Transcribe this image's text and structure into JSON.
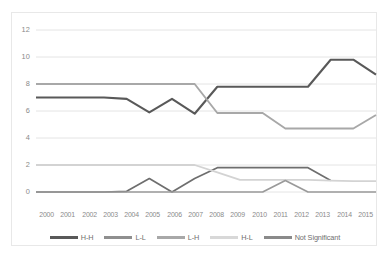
{
  "chart_data": {
    "type": "line",
    "title": "",
    "subtitle": "",
    "xlabel": "",
    "ylabel": "",
    "ylim": [
      0,
      12
    ],
    "yticks": [
      0,
      2,
      4,
      6,
      8,
      10,
      12
    ],
    "grid": true,
    "legend_position": "bottom",
    "categories": [
      "2000",
      "2001",
      "2002",
      "2003",
      "2004",
      "2005",
      "2006",
      "2007",
      "2008",
      "2009",
      "2010",
      "2011",
      "2012",
      "2013",
      "2014",
      "2015"
    ],
    "series": [
      {
        "name": "H-H",
        "color": "#595959",
        "width": 2.1,
        "values": [
          7.0,
          7.0,
          7.0,
          7.0,
          6.9,
          5.9,
          6.9,
          5.8,
          7.8,
          7.8,
          7.8,
          7.8,
          7.8,
          9.8,
          9.8,
          8.7
        ]
      },
      {
        "name": "L-L",
        "color": "#6e6e6e",
        "width": 1.7,
        "values": [
          0.0,
          0.0,
          0.0,
          0.0,
          0.05,
          1.0,
          0.0,
          1.0,
          1.8,
          1.8,
          1.8,
          1.8,
          1.8,
          0.85,
          null,
          null
        ]
      },
      {
        "name": "L-H",
        "color": "#a8a8a8",
        "width": 1.9,
        "values": [
          8.0,
          8.0,
          8.0,
          8.0,
          8.0,
          8.0,
          8.0,
          8.0,
          5.85,
          5.85,
          5.85,
          4.7,
          4.7,
          4.7,
          4.7,
          5.7
        ]
      },
      {
        "name": "H-L",
        "color": "#d3d3d3",
        "width": 1.8,
        "values": [
          2.0,
          2.0,
          2.0,
          2.0,
          2.0,
          2.0,
          2.0,
          2.0,
          1.45,
          0.9,
          0.9,
          0.9,
          0.9,
          0.85,
          0.8,
          0.8
        ]
      },
      {
        "name": "Not Significant",
        "color": "#9a9a9a",
        "width": 1.7,
        "values": [
          0.0,
          0.0,
          0.0,
          0.0,
          0.0,
          0.0,
          0.0,
          0.0,
          0.0,
          0.0,
          0.0,
          0.85,
          0.0,
          0.0,
          0.0,
          0.0
        ]
      }
    ]
  },
  "axes": {
    "y_tick_labels": [
      "12",
      "10",
      "8",
      "6",
      "4",
      "2",
      "0"
    ]
  },
  "legend": {
    "items": [
      {
        "label": "H-H",
        "color": "#595959"
      },
      {
        "label": "L-L",
        "color": "#8f8f8f"
      },
      {
        "label": "L-H",
        "color": "#a8a8a8"
      },
      {
        "label": "H-L",
        "color": "#d8d8d8"
      },
      {
        "label": "Not Significant",
        "color": "#8a8a8a"
      }
    ]
  }
}
